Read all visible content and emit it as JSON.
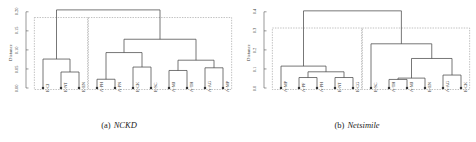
{
  "figure": {
    "background": "#ffffff",
    "line_color": "#4a4a4a",
    "box_color": "#8c8c8c",
    "node_color": "#333333"
  },
  "panels": [
    {
      "id": "a",
      "caption_id": "(a)",
      "caption_name": "NCKD",
      "axis": {
        "title": "Distance",
        "ticks": [
          "0.00",
          "0.05",
          "0.10",
          "0.15",
          "0.20"
        ],
        "tick_values": [
          0.0,
          0.05,
          0.1,
          0.15,
          0.2
        ],
        "ymin": 0.0,
        "ymax": 0.21
      },
      "leaves": [
        "E-CI",
        "E-NT",
        "E-EN",
        "A-PH",
        "A-PN",
        "E-CK",
        "E-SC",
        "A-MJ",
        "A-TH",
        "A-AG",
        "A-MP"
      ]
    },
    {
      "id": "b",
      "caption_id": "(b)",
      "caption_name": "Netsimile",
      "axis": {
        "title": "Distance",
        "ticks": [
          "0.0",
          "0.1",
          "0.2",
          "0.3",
          "0.4"
        ],
        "tick_values": [
          0.0,
          0.1,
          0.2,
          0.3,
          0.4
        ],
        "ymin": 0.0,
        "ymax": 0.42
      },
      "leaves": [
        "A-MP",
        "A-PF",
        "A-PH",
        "E-NT",
        "E-CG",
        "E-SC",
        "A-TH",
        "A-MJ",
        "E-EN",
        "A-AG",
        "E-CK"
      ]
    }
  ],
  "chart_data": [
    {
      "type": "dendrogram",
      "panel": "a",
      "title": "NCKD",
      "ylabel": "Distance",
      "xlabel": "",
      "ylim": [
        0.0,
        0.21
      ],
      "yticks": [
        0.0,
        0.05,
        0.1,
        0.15,
        0.2
      ],
      "grid": false,
      "legend": "none",
      "leaves": [
        "E-CI",
        "E-NT",
        "E-EN",
        "A-PH",
        "A-PN",
        "E-CK",
        "E-SC",
        "A-MJ",
        "A-TH",
        "A-AG",
        "A-MP"
      ],
      "merges": [
        {
          "left": "E-NT",
          "right": "E-EN",
          "height": 0.042
        },
        {
          "left": "E-CI",
          "right": "{E-NT,E-EN}",
          "height": 0.076
        },
        {
          "left": "A-PH",
          "right": "A-PN",
          "height": 0.023
        },
        {
          "left": "E-CK",
          "right": "E-SC",
          "height": 0.055
        },
        {
          "left": "{A-PH,A-PN}",
          "right": "{E-CK,E-SC}",
          "height": 0.093
        },
        {
          "left": "A-MJ",
          "right": "A-TH",
          "height": 0.046
        },
        {
          "left": "A-AG",
          "right": "A-MP",
          "height": 0.053
        },
        {
          "left": "{A-MJ,A-TH}",
          "right": "{A-AG,A-MP}",
          "height": 0.073
        },
        {
          "left": "{A-PH,A-PN,E-CK,E-SC}",
          "right": "{A-MJ,A-TH,A-AG,A-MP}",
          "height": 0.128
        },
        {
          "left": "{E-CI,E-NT,E-EN}",
          "right": "{A-PH,A-PN,E-CK,E-SC,A-MJ,A-TH,A-AG,A-MP}",
          "height": 0.205
        }
      ],
      "cluster_boxes": [
        {
          "members": [
            "E-CI",
            "E-NT",
            "E-EN"
          ],
          "top": 0.185
        },
        {
          "members": [
            "A-PH",
            "A-PN",
            "E-CK",
            "E-SC",
            "A-MJ",
            "A-TH",
            "A-AG",
            "A-MP"
          ],
          "top": 0.185
        }
      ]
    },
    {
      "type": "dendrogram",
      "panel": "b",
      "title": "Netsimile",
      "ylabel": "Distance",
      "xlabel": "",
      "ylim": [
        0.0,
        0.42
      ],
      "yticks": [
        0.0,
        0.1,
        0.2,
        0.3,
        0.4
      ],
      "grid": false,
      "legend": "none",
      "leaves": [
        "A-MP",
        "A-PF",
        "A-PH",
        "E-NT",
        "E-CG",
        "E-SC",
        "A-TH",
        "A-MJ",
        "E-EN",
        "A-AG",
        "E-CK"
      ],
      "merges": [
        {
          "left": "A-PF",
          "right": "A-PH",
          "height": 0.055
        },
        {
          "left": "E-NT",
          "right": "E-CG",
          "height": 0.055
        },
        {
          "left": "{A-PF,A-PH}",
          "right": "{E-NT,E-CG}",
          "height": 0.085
        },
        {
          "left": "A-MP",
          "right": "{A-PF,A-PH,E-NT,E-CG}",
          "height": 0.115
        },
        {
          "left": "A-TH",
          "right": "A-MJ",
          "height": 0.045
        },
        {
          "left": "{A-TH,A-MJ}",
          "right": "E-EN",
          "height": 0.052
        },
        {
          "left": "A-AG",
          "right": "E-CK",
          "height": 0.068
        },
        {
          "left": "{A-TH,A-MJ,E-EN}",
          "right": "{A-AG,E-CK}",
          "height": 0.155
        },
        {
          "left": "E-SC",
          "right": "{A-TH,A-MJ,E-EN,A-AG,E-CK}",
          "height": 0.232
        },
        {
          "left": "{A-MP,A-PF,A-PH,E-NT,E-CG}",
          "right": "{E-SC,A-TH,A-MJ,E-EN,A-AG,E-CK}",
          "height": 0.405
        }
      ],
      "cluster_boxes": [
        {
          "members": [
            "A-MP",
            "A-PF",
            "A-PH",
            "E-NT",
            "E-CG"
          ],
          "top": 0.315
        },
        {
          "members": [
            "E-SC",
            "A-TH",
            "A-MJ",
            "E-EN",
            "A-AG",
            "E-CK"
          ],
          "top": 0.315
        }
      ]
    }
  ]
}
